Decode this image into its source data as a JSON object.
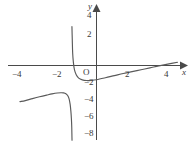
{
  "figure": {
    "title": "",
    "width": 193,
    "height": 145,
    "background": "#ffffff",
    "ink_color": "#4a4a4a",
    "text_color": "#3a3a3a"
  },
  "axes": {
    "x_name": "x",
    "y_name": "y",
    "origin_label": "O",
    "x_ticks": [
      {
        "label": "−4",
        "value": -4,
        "px": 18
      },
      {
        "label": "−2",
        "value": -2,
        "px": 58
      },
      {
        "label": "2",
        "value": 2,
        "px": 128
      },
      {
        "label": "4",
        "value": 4,
        "px": 167
      }
    ],
    "y_ticks": [
      {
        "label": "4",
        "value": 4,
        "px": 16
      },
      {
        "label": "2",
        "value": 2,
        "px": 35
      },
      {
        "label": "−2",
        "value": -2,
        "px": 83
      },
      {
        "label": "−4",
        "value": -4,
        "px": 100
      },
      {
        "label": "−6",
        "value": -6,
        "px": 117
      },
      {
        "label": "−8",
        "value": -8,
        "px": 134
      }
    ]
  },
  "chart_data": {
    "type": "line",
    "title": "",
    "xlabel": "x",
    "ylabel": "y",
    "xlim": [
      -4.8,
      5.2
    ],
    "ylim": [
      -8.8,
      4.8
    ],
    "grid": false,
    "legend": null,
    "asymptotes": [
      {
        "kind": "vertical",
        "x": -1.3
      }
    ],
    "series": [
      {
        "name": "upper-left-branch",
        "comment": "rises steeply to +infinity just left of the vertical asymptote x = -1.3",
        "points": [
          [
            -1.38,
            4.6
          ],
          [
            -1.36,
            3.0
          ],
          [
            -1.34,
            1.5
          ],
          [
            -1.3,
            0.4
          ],
          [
            -1.24,
            -0.5
          ],
          [
            -1.14,
            -1.1
          ],
          [
            -1.0,
            -1.5
          ],
          [
            -0.8,
            -1.7
          ],
          [
            -0.55,
            -1.78
          ],
          [
            -0.3,
            -1.76
          ],
          [
            0.0,
            -1.68
          ],
          [
            0.5,
            -1.45
          ],
          [
            1.0,
            -1.2
          ],
          [
            1.5,
            -0.95
          ],
          [
            2.0,
            -0.72
          ],
          [
            2.5,
            -0.5
          ],
          [
            3.0,
            -0.28
          ],
          [
            3.5,
            -0.05
          ],
          [
            4.0,
            0.16
          ],
          [
            4.55,
            0.38
          ]
        ]
      },
      {
        "name": "lower-left-branch",
        "comment": "enters from the left near y = -4.2, peaks near (-2.1, -3.2), then falls to -infinity at the asymptote",
        "points": [
          [
            -4.3,
            -4.28
          ],
          [
            -4.0,
            -4.15
          ],
          [
            -3.6,
            -3.92
          ],
          [
            -3.2,
            -3.7
          ],
          [
            -2.8,
            -3.5
          ],
          [
            -2.5,
            -3.36
          ],
          [
            -2.2,
            -3.25
          ],
          [
            -2.0,
            -3.22
          ],
          [
            -1.85,
            -3.24
          ],
          [
            -1.72,
            -3.34
          ],
          [
            -1.62,
            -3.55
          ],
          [
            -1.54,
            -3.95
          ],
          [
            -1.48,
            -4.6
          ],
          [
            -1.44,
            -5.4
          ],
          [
            -1.41,
            -6.3
          ],
          [
            -1.39,
            -7.3
          ],
          [
            -1.38,
            -8.4
          ],
          [
            -1.375,
            -8.85
          ]
        ]
      }
    ]
  }
}
